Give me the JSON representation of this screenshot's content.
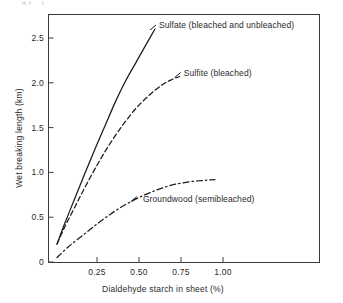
{
  "figure": {
    "top_cut_text": "g      ( .. )",
    "background": "#ffffff",
    "ink_color": "#1b1b1b"
  },
  "chart_data": {
    "type": "line",
    "title": "",
    "xlabel": "Dialdehyde starch in sheet (%)",
    "ylabel": "Wet breaking length (km)",
    "xlim": [
      0.0,
      1.13
    ],
    "ylim": [
      0.0,
      2.77
    ],
    "xticks": [
      0.25,
      0.5,
      0.75,
      1.0
    ],
    "xticklabels": [
      "0.25",
      "0.50",
      "0.75",
      "1.00"
    ],
    "yticks": [
      0,
      0.5,
      1.0,
      1.5,
      2.0,
      2.5
    ],
    "yticklabels": [
      "0",
      "0.5",
      "1.0",
      "1.5",
      "2.0",
      "2.5"
    ],
    "grid": false,
    "legend": "inline-annotations",
    "series": [
      {
        "name": "Sulfate (bleached and unbleached)",
        "style": "solid",
        "x": [
          0.012,
          0.06,
          0.12,
          0.18,
          0.24,
          0.3,
          0.36,
          0.42,
          0.48,
          0.54,
          0.595
        ],
        "y": [
          0.2,
          0.44,
          0.72,
          1.0,
          1.27,
          1.53,
          1.79,
          2.02,
          2.22,
          2.42,
          2.6
        ]
      },
      {
        "name": "Sulfite (bleached)",
        "style": "dashed",
        "x": [
          0.012,
          0.06,
          0.12,
          0.18,
          0.25,
          0.32,
          0.4,
          0.48,
          0.56,
          0.64,
          0.7,
          0.742
        ],
        "y": [
          0.2,
          0.4,
          0.62,
          0.84,
          1.08,
          1.3,
          1.52,
          1.71,
          1.86,
          1.98,
          2.04,
          2.07
        ]
      },
      {
        "name": "Groundwood (semibleached)",
        "style": "dash-dot",
        "x": [
          0.012,
          0.08,
          0.16,
          0.24,
          0.32,
          0.4,
          0.5,
          0.6,
          0.7,
          0.8,
          0.88,
          0.952
        ],
        "y": [
          0.05,
          0.17,
          0.29,
          0.41,
          0.52,
          0.62,
          0.72,
          0.8,
          0.86,
          0.895,
          0.91,
          0.92
        ]
      }
    ],
    "annotations": [
      {
        "text": "Sulfate (bleached and unbleached)",
        "series": "Sulfate (bleached and unbleached)",
        "x": 0.63,
        "y": 2.66
      },
      {
        "text": "Sulfite (bleached)",
        "series": "Sulfite (bleached)",
        "x": 0.8,
        "y": 2.12
      },
      {
        "text": "Groundwood (semibleached)",
        "series": "Groundwood (semibleached)",
        "x": 0.81,
        "y": 0.78
      }
    ]
  }
}
